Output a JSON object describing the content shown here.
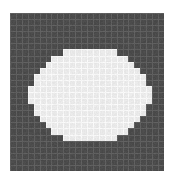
{
  "figure": {
    "name": "pixelated-ellipse-raster",
    "canvas_width": 175,
    "canvas_height": 184,
    "background_color": "#ffffff"
  },
  "grid": {
    "origin_x": 10,
    "origin_y": 13,
    "width": 154,
    "height": 158,
    "columns": 26,
    "rows": 26,
    "cell_width": 5.923,
    "cell_height": 6.077,
    "cell_color_outside": "#4b4b4b",
    "cell_color_inside": "#e9e9e9",
    "gridline_color_outside": "#5f5f5f",
    "gridline_color_inside": "#f7f7f7",
    "gridline_width": 1,
    "noise_amplitude": 9
  },
  "ellipse": {
    "center_x": 87.0,
    "center_y": 93.0,
    "semi_axis_x": 54.0,
    "semi_axis_y": 44.0,
    "fill_color": "#e9e9e9",
    "quantized_to_grid": true,
    "bounds": {
      "left": 33,
      "right": 141,
      "top": 49,
      "bottom": 137
    }
  },
  "chart_data": {
    "type": "heatmap",
    "title": "",
    "xlabel": "",
    "ylabel": "",
    "grid": true,
    "legend": "none",
    "columns": 26,
    "rows": 26,
    "value_labels": {
      "0": "outside ellipse (dark)",
      "1": "inside ellipse (light)"
    },
    "colors": [
      "#4b4b4b",
      "#e9e9e9"
    ],
    "values": [
      [
        0,
        0,
        0,
        0,
        0,
        0,
        0,
        0,
        0,
        0,
        0,
        0,
        0,
        0,
        0,
        0,
        0,
        0,
        0,
        0,
        0,
        0,
        0,
        0,
        0,
        0
      ],
      [
        0,
        0,
        0,
        0,
        0,
        0,
        0,
        0,
        0,
        0,
        0,
        0,
        0,
        0,
        0,
        0,
        0,
        0,
        0,
        0,
        0,
        0,
        0,
        0,
        0,
        0
      ],
      [
        0,
        0,
        0,
        0,
        0,
        0,
        0,
        0,
        0,
        0,
        0,
        0,
        0,
        0,
        0,
        0,
        0,
        0,
        0,
        0,
        0,
        0,
        0,
        0,
        0,
        0
      ],
      [
        0,
        0,
        0,
        0,
        0,
        0,
        0,
        0,
        0,
        0,
        0,
        0,
        0,
        0,
        0,
        0,
        0,
        0,
        0,
        0,
        0,
        0,
        0,
        0,
        0,
        0
      ],
      [
        0,
        0,
        0,
        0,
        0,
        0,
        0,
        0,
        0,
        0,
        0,
        0,
        0,
        0,
        0,
        0,
        0,
        0,
        0,
        0,
        0,
        0,
        0,
        0,
        0,
        0
      ],
      [
        0,
        0,
        0,
        0,
        0,
        0,
        0,
        0,
        0,
        0,
        0,
        0,
        0,
        0,
        0,
        0,
        0,
        0,
        0,
        0,
        0,
        0,
        0,
        0,
        0,
        0
      ],
      [
        0,
        0,
        0,
        0,
        0,
        0,
        0,
        0,
        0,
        1,
        1,
        1,
        1,
        1,
        1,
        1,
        1,
        1,
        0,
        0,
        0,
        0,
        0,
        0,
        0,
        0
      ],
      [
        0,
        0,
        0,
        0,
        0,
        0,
        0,
        1,
        1,
        1,
        1,
        1,
        1,
        1,
        1,
        1,
        1,
        1,
        1,
        1,
        0,
        0,
        0,
        0,
        0,
        0
      ],
      [
        0,
        0,
        0,
        0,
        0,
        0,
        1,
        1,
        1,
        1,
        1,
        1,
        1,
        1,
        1,
        1,
        1,
        1,
        1,
        1,
        1,
        0,
        0,
        0,
        0,
        0
      ],
      [
        0,
        0,
        0,
        0,
        0,
        1,
        1,
        1,
        1,
        1,
        1,
        1,
        1,
        1,
        1,
        1,
        1,
        1,
        1,
        1,
        1,
        1,
        0,
        0,
        0,
        0
      ],
      [
        0,
        0,
        0,
        0,
        1,
        1,
        1,
        1,
        1,
        1,
        1,
        1,
        1,
        1,
        1,
        1,
        1,
        1,
        1,
        1,
        1,
        1,
        1,
        0,
        0,
        0
      ],
      [
        0,
        0,
        0,
        0,
        1,
        1,
        1,
        1,
        1,
        1,
        1,
        1,
        1,
        1,
        1,
        1,
        1,
        1,
        1,
        1,
        1,
        1,
        1,
        0,
        0,
        0
      ],
      [
        0,
        0,
        0,
        1,
        1,
        1,
        1,
        1,
        1,
        1,
        1,
        1,
        1,
        1,
        1,
        1,
        1,
        1,
        1,
        1,
        1,
        1,
        1,
        1,
        0,
        0
      ],
      [
        0,
        0,
        0,
        1,
        1,
        1,
        1,
        1,
        1,
        1,
        1,
        1,
        1,
        1,
        1,
        1,
        1,
        1,
        1,
        1,
        1,
        1,
        1,
        1,
        0,
        0
      ],
      [
        0,
        0,
        0,
        1,
        1,
        1,
        1,
        1,
        1,
        1,
        1,
        1,
        1,
        1,
        1,
        1,
        1,
        1,
        1,
        1,
        1,
        1,
        1,
        1,
        0,
        0
      ],
      [
        0,
        0,
        0,
        0,
        1,
        1,
        1,
        1,
        1,
        1,
        1,
        1,
        1,
        1,
        1,
        1,
        1,
        1,
        1,
        1,
        1,
        1,
        1,
        0,
        0,
        0
      ],
      [
        0,
        0,
        0,
        0,
        1,
        1,
        1,
        1,
        1,
        1,
        1,
        1,
        1,
        1,
        1,
        1,
        1,
        1,
        1,
        1,
        1,
        1,
        1,
        0,
        0,
        0
      ],
      [
        0,
        0,
        0,
        0,
        0,
        1,
        1,
        1,
        1,
        1,
        1,
        1,
        1,
        1,
        1,
        1,
        1,
        1,
        1,
        1,
        1,
        1,
        0,
        0,
        0,
        0
      ],
      [
        0,
        0,
        0,
        0,
        0,
        0,
        1,
        1,
        1,
        1,
        1,
        1,
        1,
        1,
        1,
        1,
        1,
        1,
        1,
        1,
        1,
        0,
        0,
        0,
        0,
        0
      ],
      [
        0,
        0,
        0,
        0,
        0,
        0,
        0,
        1,
        1,
        1,
        1,
        1,
        1,
        1,
        1,
        1,
        1,
        1,
        1,
        1,
        0,
        0,
        0,
        0,
        0,
        0
      ],
      [
        0,
        0,
        0,
        0,
        0,
        0,
        0,
        0,
        0,
        1,
        1,
        1,
        1,
        1,
        1,
        1,
        1,
        1,
        0,
        0,
        0,
        0,
        0,
        0,
        0,
        0
      ],
      [
        0,
        0,
        0,
        0,
        0,
        0,
        0,
        0,
        0,
        0,
        0,
        0,
        0,
        0,
        0,
        0,
        0,
        0,
        0,
        0,
        0,
        0,
        0,
        0,
        0,
        0
      ],
      [
        0,
        0,
        0,
        0,
        0,
        0,
        0,
        0,
        0,
        0,
        0,
        0,
        0,
        0,
        0,
        0,
        0,
        0,
        0,
        0,
        0,
        0,
        0,
        0,
        0,
        0
      ],
      [
        0,
        0,
        0,
        0,
        0,
        0,
        0,
        0,
        0,
        0,
        0,
        0,
        0,
        0,
        0,
        0,
        0,
        0,
        0,
        0,
        0,
        0,
        0,
        0,
        0,
        0
      ],
      [
        0,
        0,
        0,
        0,
        0,
        0,
        0,
        0,
        0,
        0,
        0,
        0,
        0,
        0,
        0,
        0,
        0,
        0,
        0,
        0,
        0,
        0,
        0,
        0,
        0,
        0
      ],
      [
        0,
        0,
        0,
        0,
        0,
        0,
        0,
        0,
        0,
        0,
        0,
        0,
        0,
        0,
        0,
        0,
        0,
        0,
        0,
        0,
        0,
        0,
        0,
        0,
        0,
        0
      ]
    ]
  }
}
